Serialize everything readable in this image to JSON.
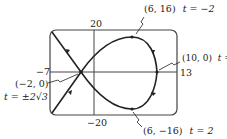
{
  "figure": {
    "type": "parametric-curve-graph",
    "window": {
      "xmin": "-7",
      "xmax": "13",
      "ymax": "20",
      "ymin": "-20"
    },
    "axis_labels": {
      "top": "20",
      "bottom": "−20",
      "left": "−7",
      "right": "13"
    },
    "annotations": [
      {
        "point": "(6, 16)",
        "param": "t = −2"
      },
      {
        "point": "(10, 0)",
        "param": "t = 0"
      },
      {
        "point": "(−2, 0)",
        "param": "t = ±2√3"
      },
      {
        "point": "(6, −16)",
        "param": "t = 2"
      }
    ],
    "colors": {
      "curve": "#222222",
      "frame": "#333333",
      "background": "#ffffff"
    }
  }
}
